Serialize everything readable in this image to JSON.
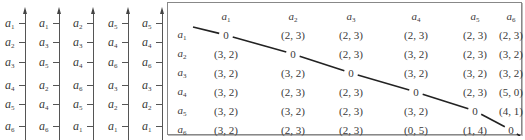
{
  "axes": [
    {
      "items": [
        "1",
        "2",
        "3",
        "4",
        "5",
        "6"
      ]
    },
    {
      "items": [
        "1",
        "3",
        "5",
        "2",
        "4",
        "6"
      ]
    },
    {
      "items": [
        "2",
        "3",
        "4",
        "6",
        "5",
        "1"
      ]
    },
    {
      "items": [
        "5",
        "4",
        "6",
        "3",
        "2",
        "1"
      ]
    },
    {
      "items": [
        "5",
        "4",
        "6",
        "3",
        "2",
        "1"
      ]
    }
  ],
  "matrix": {
    "symbol": "a",
    "columns": [
      "1",
      "2",
      "3",
      "4",
      "5",
      "6"
    ],
    "rows": [
      {
        "label": "1",
        "cells": [
          "0",
          "(2, 3)",
          "(2, 3)",
          "(2, 3)",
          "(2, 3)",
          "(2, 3)"
        ]
      },
      {
        "label": "2",
        "cells": [
          "(3, 2)",
          "0",
          "(2, 3)",
          "(3, 2)",
          "(2, 3)",
          "(3, 2)"
        ]
      },
      {
        "label": "3",
        "cells": [
          "(3, 2)",
          "(3, 2)",
          "0",
          "(3, 2)",
          "(3, 2)",
          "(3, 2)"
        ]
      },
      {
        "label": "4",
        "cells": [
          "(3, 2)",
          "(2, 3)",
          "(2, 3)",
          "0",
          "(2, 3)",
          "(5, 0)"
        ]
      },
      {
        "label": "5",
        "cells": [
          "(3, 2)",
          "(3, 2)",
          "(2, 3)",
          "(3, 2)",
          "0",
          "(4, 1)"
        ]
      },
      {
        "label": "6",
        "cells": [
          "(3, 2)",
          "(2, 3)",
          "(2, 3)",
          "(0, 5)",
          "(1, 4)",
          "0"
        ]
      }
    ]
  }
}
